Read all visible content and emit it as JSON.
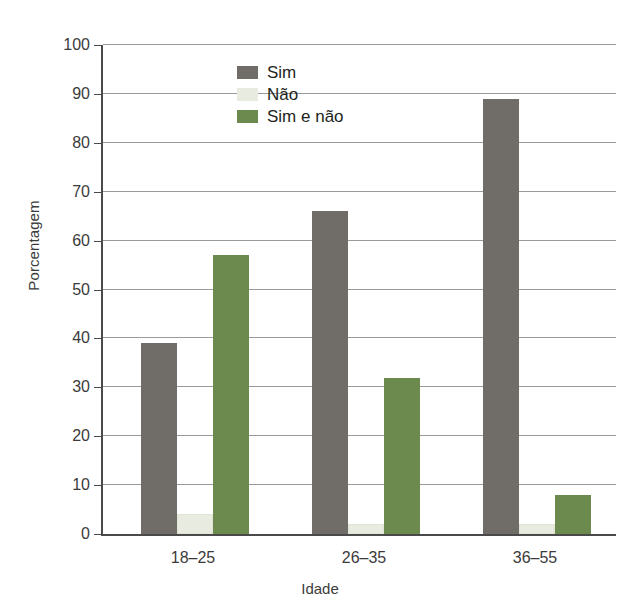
{
  "chart_data": {
    "type": "bar",
    "title": "",
    "subtitle": "",
    "xlabel": "Idade",
    "ylabel": "Porcentagem",
    "categories": [
      "18–25",
      "26–35",
      "36–55"
    ],
    "series": [
      {
        "name": "Sim",
        "color": "#706c68",
        "values": [
          39,
          66,
          89
        ]
      },
      {
        "name": "Não",
        "color": "#e8ece0",
        "values": [
          4,
          2,
          2
        ]
      },
      {
        "name": "Sim e não",
        "color": "#6d8a4e",
        "values": [
          57,
          32,
          8
        ]
      }
    ],
    "ylim": [
      0,
      100
    ],
    "yticks": [
      0,
      10,
      20,
      30,
      40,
      50,
      60,
      70,
      80,
      90,
      100
    ],
    "ytick_labels": [
      "0",
      "10",
      "20",
      "30",
      "40",
      "50",
      "60",
      "70",
      "80",
      "90",
      "100"
    ],
    "grid": "horizontal",
    "legend_position": "top-center",
    "legend_entries": [
      "Sim",
      "Não",
      "Sim e não"
    ],
    "axis_color": "#4a4a4a",
    "grid_color": "#9a9a9a",
    "background": "#ffffff"
  }
}
